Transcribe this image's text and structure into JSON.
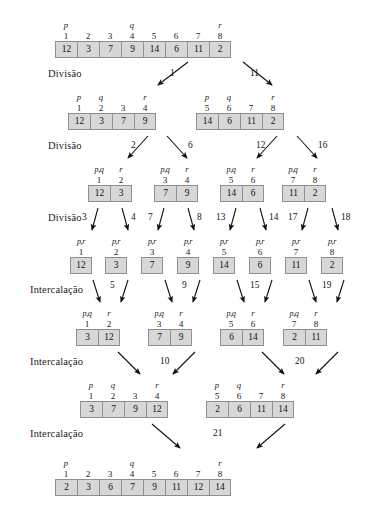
{
  "diagram": {
    "stage_labels": [
      {
        "text": "Divisão",
        "x": 48,
        "y": 68
      },
      {
        "text": "Divisão",
        "x": 48,
        "y": 140
      },
      {
        "text": "Divisão",
        "x": 48,
        "y": 212
      },
      {
        "text": "Intercalação",
        "x": 30,
        "y": 284
      },
      {
        "text": "Intercalação",
        "x": 30,
        "y": 356
      },
      {
        "text": "Intercalação",
        "x": 30,
        "y": 428
      }
    ],
    "arrays": [
      {
        "id": "root",
        "x": 143,
        "y": 20,
        "values": [
          "12",
          "3",
          "7",
          "9",
          "14",
          "6",
          "11",
          "2"
        ],
        "indices": [
          "1",
          "2",
          "3",
          "4",
          "5",
          "6",
          "7",
          "8"
        ],
        "pointers": [
          "p",
          "",
          "",
          "q",
          "",
          "",
          "",
          "r"
        ]
      },
      {
        "id": "L1-left",
        "x": 112,
        "y": 92,
        "values": [
          "12",
          "3",
          "7",
          "9"
        ],
        "indices": [
          "1",
          "2",
          "3",
          "4"
        ],
        "pointers": [
          "p",
          "q",
          "",
          "r"
        ]
      },
      {
        "id": "L1-right",
        "x": 240,
        "y": 92,
        "values": [
          "14",
          "6",
          "11",
          "2"
        ],
        "indices": [
          "5",
          "6",
          "7",
          "8"
        ],
        "pointers": [
          "p",
          "q",
          "",
          "r"
        ]
      },
      {
        "id": "L2-a",
        "x": 110,
        "y": 164,
        "values": [
          "12",
          "3"
        ],
        "indices": [
          "1",
          "2"
        ],
        "pointers": [
          "p,q",
          "r"
        ]
      },
      {
        "id": "L2-b",
        "x": 176,
        "y": 164,
        "values": [
          "7",
          "9"
        ],
        "indices": [
          "3",
          "4"
        ],
        "pointers": [
          "p,q",
          "r"
        ]
      },
      {
        "id": "L2-c",
        "x": 242,
        "y": 164,
        "values": [
          "14",
          "6"
        ],
        "indices": [
          "5",
          "6"
        ],
        "pointers": [
          "p,q",
          "r"
        ]
      },
      {
        "id": "L2-d",
        "x": 304,
        "y": 164,
        "values": [
          "11",
          "2"
        ],
        "indices": [
          "7",
          "8"
        ],
        "pointers": [
          "p,q",
          "r"
        ]
      },
      {
        "id": "L3-1",
        "x": 81,
        "y": 236,
        "values": [
          "12"
        ],
        "indices": [
          "1"
        ],
        "pointers": [
          "p,r"
        ]
      },
      {
        "id": "L3-2",
        "x": 116,
        "y": 236,
        "values": [
          "3"
        ],
        "indices": [
          "2"
        ],
        "pointers": [
          "p,r"
        ]
      },
      {
        "id": "L3-3",
        "x": 152,
        "y": 236,
        "values": [
          "7"
        ],
        "indices": [
          "3"
        ],
        "pointers": [
          "p,r"
        ]
      },
      {
        "id": "L3-4",
        "x": 188,
        "y": 236,
        "values": [
          "9"
        ],
        "indices": [
          "4"
        ],
        "pointers": [
          "p,r"
        ]
      },
      {
        "id": "L3-5",
        "x": 224,
        "y": 236,
        "values": [
          "14"
        ],
        "indices": [
          "5"
        ],
        "pointers": [
          "p,r"
        ]
      },
      {
        "id": "L3-6",
        "x": 260,
        "y": 236,
        "values": [
          "6"
        ],
        "indices": [
          "6"
        ],
        "pointers": [
          "p,r"
        ]
      },
      {
        "id": "L3-7",
        "x": 296,
        "y": 236,
        "values": [
          "11"
        ],
        "indices": [
          "7"
        ],
        "pointers": [
          "p,r"
        ]
      },
      {
        "id": "L3-8",
        "x": 332,
        "y": 236,
        "values": [
          "2"
        ],
        "indices": [
          "8"
        ],
        "pointers": [
          "p,r"
        ]
      },
      {
        "id": "M1-a",
        "x": 98,
        "y": 308,
        "values": [
          "3",
          "12"
        ],
        "indices": [
          "1",
          "2"
        ],
        "pointers": [
          "p,q",
          "r"
        ]
      },
      {
        "id": "M1-b",
        "x": 170,
        "y": 308,
        "values": [
          "7",
          "9"
        ],
        "indices": [
          "3",
          "4"
        ],
        "pointers": [
          "p,q",
          "r"
        ]
      },
      {
        "id": "M1-c",
        "x": 242,
        "y": 308,
        "values": [
          "6",
          "14"
        ],
        "indices": [
          "5",
          "6"
        ],
        "pointers": [
          "p,q",
          "r"
        ]
      },
      {
        "id": "M1-d",
        "x": 305,
        "y": 308,
        "values": [
          "2",
          "11"
        ],
        "indices": [
          "7",
          "8"
        ],
        "pointers": [
          "p,q",
          "r"
        ]
      },
      {
        "id": "M2-left",
        "x": 124,
        "y": 380,
        "values": [
          "3",
          "7",
          "9",
          "12"
        ],
        "indices": [
          "1",
          "2",
          "3",
          "4"
        ],
        "pointers": [
          "p",
          "q",
          "",
          "r"
        ]
      },
      {
        "id": "M2-right",
        "x": 250,
        "y": 380,
        "values": [
          "2",
          "6",
          "11",
          "14"
        ],
        "indices": [
          "5",
          "6",
          "7",
          "8"
        ],
        "pointers": [
          "p",
          "q",
          "",
          "r"
        ]
      },
      {
        "id": "final",
        "x": 143,
        "y": 458,
        "values": [
          "2",
          "3",
          "6",
          "7",
          "9",
          "11",
          "12",
          "14"
        ],
        "indices": [
          "1",
          "2",
          "3",
          "4",
          "5",
          "6",
          "7",
          "8"
        ],
        "pointers": [
          "p",
          "",
          "",
          "q",
          "",
          "",
          "",
          "r"
        ]
      }
    ],
    "arrows": [
      {
        "x1": 188,
        "y1": 62,
        "x2": 158,
        "y2": 85
      },
      {
        "x1": 243,
        "y1": 62,
        "x2": 272,
        "y2": 85
      },
      {
        "x1": 148,
        "y1": 136,
        "x2": 128,
        "y2": 158
      },
      {
        "x1": 167,
        "y1": 136,
        "x2": 187,
        "y2": 158
      },
      {
        "x1": 277,
        "y1": 136,
        "x2": 257,
        "y2": 158
      },
      {
        "x1": 297,
        "y1": 136,
        "x2": 317,
        "y2": 158
      },
      {
        "x1": 98,
        "y1": 208,
        "x2": 92,
        "y2": 230
      },
      {
        "x1": 122,
        "y1": 208,
        "x2": 128,
        "y2": 230
      },
      {
        "x1": 164,
        "y1": 208,
        "x2": 158,
        "y2": 230
      },
      {
        "x1": 188,
        "y1": 208,
        "x2": 194,
        "y2": 230
      },
      {
        "x1": 236,
        "y1": 208,
        "x2": 230,
        "y2": 230
      },
      {
        "x1": 260,
        "y1": 208,
        "x2": 266,
        "y2": 230
      },
      {
        "x1": 308,
        "y1": 208,
        "x2": 302,
        "y2": 230
      },
      {
        "x1": 332,
        "y1": 208,
        "x2": 338,
        "y2": 230
      },
      {
        "x1": 93,
        "y1": 280,
        "x2": 100,
        "y2": 302
      },
      {
        "x1": 128,
        "y1": 280,
        "x2": 121,
        "y2": 302
      },
      {
        "x1": 165,
        "y1": 280,
        "x2": 172,
        "y2": 302
      },
      {
        "x1": 200,
        "y1": 280,
        "x2": 193,
        "y2": 302
      },
      {
        "x1": 237,
        "y1": 280,
        "x2": 244,
        "y2": 302
      },
      {
        "x1": 272,
        "y1": 280,
        "x2": 265,
        "y2": 302
      },
      {
        "x1": 309,
        "y1": 280,
        "x2": 316,
        "y2": 302
      },
      {
        "x1": 344,
        "y1": 280,
        "x2": 337,
        "y2": 302
      },
      {
        "x1": 118,
        "y1": 352,
        "x2": 140,
        "y2": 374
      },
      {
        "x1": 195,
        "y1": 352,
        "x2": 173,
        "y2": 374
      },
      {
        "x1": 262,
        "y1": 352,
        "x2": 284,
        "y2": 374
      },
      {
        "x1": 338,
        "y1": 352,
        "x2": 316,
        "y2": 374
      },
      {
        "x1": 152,
        "y1": 424,
        "x2": 180,
        "y2": 448
      },
      {
        "x1": 285,
        "y1": 424,
        "x2": 257,
        "y2": 448
      }
    ],
    "arrow_labels": [
      {
        "text": "1",
        "x": 170,
        "y": 68
      },
      {
        "text": "11",
        "x": 250,
        "y": 68
      },
      {
        "text": "2",
        "x": 131,
        "y": 140
      },
      {
        "text": "6",
        "x": 188,
        "y": 140
      },
      {
        "text": "12",
        "x": 256,
        "y": 140
      },
      {
        "text": "16",
        "x": 318,
        "y": 140
      },
      {
        "text": "3",
        "x": 82,
        "y": 212
      },
      {
        "text": "4",
        "x": 131,
        "y": 212
      },
      {
        "text": "7",
        "x": 148,
        "y": 212
      },
      {
        "text": "8",
        "x": 197,
        "y": 212
      },
      {
        "text": "13",
        "x": 216,
        "y": 212
      },
      {
        "text": "14",
        "x": 269,
        "y": 212
      },
      {
        "text": "17",
        "x": 288,
        "y": 212
      },
      {
        "text": "18",
        "x": 341,
        "y": 212
      },
      {
        "text": "5",
        "x": 110,
        "y": 280
      },
      {
        "text": "9",
        "x": 182,
        "y": 280
      },
      {
        "text": "15",
        "x": 250,
        "y": 280
      },
      {
        "text": "19",
        "x": 322,
        "y": 280
      },
      {
        "text": "10",
        "x": 160,
        "y": 356
      },
      {
        "text": "20",
        "x": 295,
        "y": 356
      },
      {
        "text": "21",
        "x": 213,
        "y": 428
      }
    ],
    "colors": {
      "cell_fill": "#d7d7d7",
      "cell_border": "#8f8f8f",
      "text": "#111111",
      "background": "#ffffff"
    }
  }
}
